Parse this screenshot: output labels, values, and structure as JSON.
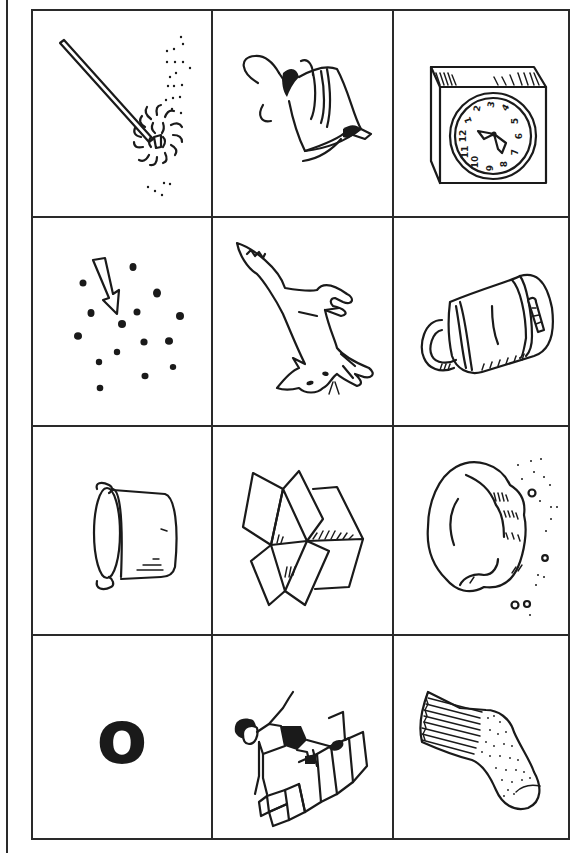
{
  "worksheet": {
    "title": "Picture grid",
    "rows": 4,
    "columns": 3,
    "line_color": "#2a2a2a",
    "cells": [
      {
        "row": 1,
        "col": 1,
        "picture": "mop",
        "label": "Mop"
      },
      {
        "row": 1,
        "col": 2,
        "picture": "spinning-top",
        "label": "Spinning top"
      },
      {
        "row": 1,
        "col": 3,
        "picture": "clock",
        "label": "Clock"
      },
      {
        "row": 2,
        "col": 1,
        "picture": "dots-with-arrow",
        "label": "Dots"
      },
      {
        "row": 2,
        "col": 2,
        "picture": "fox",
        "label": "Fox"
      },
      {
        "row": 2,
        "col": 3,
        "picture": "padlock",
        "label": "Padlock"
      },
      {
        "row": 3,
        "col": 1,
        "picture": "pot",
        "label": "Pot"
      },
      {
        "row": 3,
        "col": 2,
        "picture": "box",
        "label": "Box"
      },
      {
        "row": 3,
        "col": 3,
        "picture": "rock",
        "label": "Rock"
      },
      {
        "row": 4,
        "col": 1,
        "picture": "letter-o",
        "label": "Letter O",
        "letter": "o"
      },
      {
        "row": 4,
        "col": 2,
        "picture": "hopscotch",
        "label": "Hopscotch"
      },
      {
        "row": 4,
        "col": 3,
        "picture": "sock",
        "label": "Sock"
      }
    ],
    "clock_numerals": [
      "1",
      "2",
      "3",
      "4",
      "5",
      "6",
      "7",
      "8",
      "9",
      "10",
      "11",
      "12"
    ]
  }
}
